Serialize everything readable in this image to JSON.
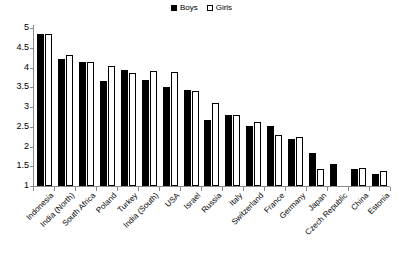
{
  "chart_data": {
    "type": "bar",
    "title": "",
    "subtitle": "",
    "xlabel": "",
    "ylabel": "",
    "ylim": [
      1,
      5
    ],
    "yticks": [
      "1",
      "1.5",
      "2",
      "2.5",
      "3",
      "3.5",
      "4",
      "4.5",
      "5"
    ],
    "ytick_values": [
      1,
      1.5,
      2,
      2.5,
      3,
      3.5,
      4,
      4.5,
      5
    ],
    "grid": false,
    "legend_position": "top-center",
    "legend": [
      "Boys",
      "Girls"
    ],
    "categories": [
      "Indonesia",
      "India (North)",
      "South Africa",
      "Poland",
      "Turkey",
      "India (South)",
      "USA",
      "Israel",
      "Russia",
      "Italy",
      "Switzerland",
      "France",
      "Germany",
      "Japan",
      "Czech Republic",
      "China",
      "Estonia"
    ],
    "series": [
      {
        "name": "Boys",
        "color": "#000000",
        "values": [
          4.85,
          4.22,
          4.14,
          3.67,
          3.93,
          3.68,
          3.51,
          3.42,
          2.68,
          2.79,
          2.53,
          2.51,
          2.19,
          1.84,
          1.57,
          1.42,
          1.31
        ]
      },
      {
        "name": "Girls",
        "color": "#ffffff",
        "values": [
          4.85,
          4.31,
          4.15,
          4.05,
          3.87,
          3.9,
          3.89,
          3.4,
          3.11,
          2.81,
          2.63,
          2.29,
          2.24,
          1.43,
          null,
          1.45,
          1.37
        ]
      }
    ]
  }
}
